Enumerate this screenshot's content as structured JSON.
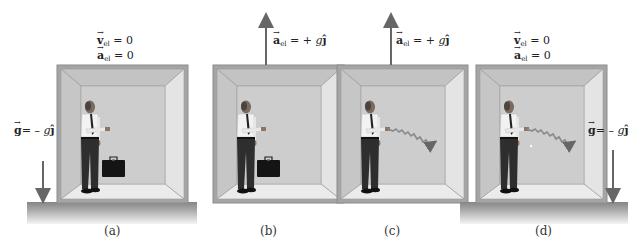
{
  "figure": {
    "panels": [
      {
        "id": "a",
        "caption": "(a)",
        "equations": [
          {
            "vec": "v",
            "sub": "el",
            "rhs": "= 0"
          },
          {
            "vec": "a",
            "sub": "el",
            "rhs": "= 0"
          }
        ],
        "gravity": {
          "vec": "g",
          "rhs_prefix": "= – ",
          "rhs_g": "g",
          "rhs_unit": "ĵ"
        },
        "object": "briefcase",
        "state": "elevator at rest on ground"
      },
      {
        "id": "b",
        "caption": "(b)",
        "equations": [
          {
            "vec": "a",
            "sub": "el",
            "rhs_prefix": "= + ",
            "rhs_g": "g",
            "rhs_unit": "ĵ"
          }
        ],
        "object": "briefcase",
        "state": "elevator accelerating upward in space"
      },
      {
        "id": "c",
        "caption": "(c)",
        "equations": [
          {
            "vec": "a",
            "sub": "el",
            "rhs_prefix": "= + ",
            "rhs_g": "g",
            "rhs_unit": "ĵ"
          }
        ],
        "object": "ball trajectory",
        "state": "elevator accelerating upward, ball thrown"
      },
      {
        "id": "d",
        "caption": "(d)",
        "equations": [
          {
            "vec": "v",
            "sub": "el",
            "rhs": "= 0"
          },
          {
            "vec": "a",
            "sub": "el",
            "rhs": "= 0"
          }
        ],
        "gravity": {
          "vec": "g",
          "rhs_prefix": "= – ",
          "rhs_g": "g",
          "rhs_unit": "ĵ"
        },
        "object": "ball trajectory",
        "state": "elevator at rest on ground, ball thrown"
      }
    ],
    "colors": {
      "frame": "#9a9a9a",
      "ceiling": "#c4c4c4",
      "back_wall": "#cfcfcf",
      "side_left": "#c8c8c8",
      "side_right": "#e2e2e2",
      "floor": "#e8e8e8",
      "ground_top": "#8a8a8a",
      "ground_bottom": "#f4f4f4",
      "arrow": "#6b6b6b",
      "trajectory": "#8a8a8a"
    }
  }
}
